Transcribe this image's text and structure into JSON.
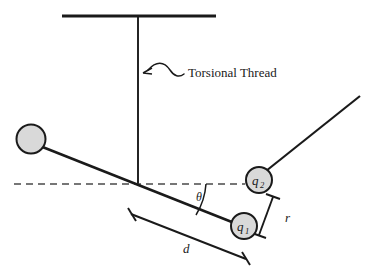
{
  "figure": {
    "background_color": "#ffffff",
    "line_color": "#1a1a1a",
    "dash_color": "#4a4a4a",
    "sphere_fill": "#d9d9d9",
    "width": 370,
    "height": 273
  },
  "labels": {
    "torsional_thread": "Torsional Thread",
    "charge_1": "q",
    "charge_1_sub": "1",
    "charge_2": "q",
    "charge_2_sub": "2",
    "angle": "θ",
    "separation": "r",
    "arm_length": "d"
  },
  "elements": {
    "ceiling_bar": "ceiling-support-bar",
    "thread": "torsional-thread-line",
    "pivot": "pivot-point",
    "rod": "balance-rod",
    "counterweight": "counterweight-sphere",
    "charge_sphere_1": "charge-sphere-q1",
    "charge_sphere_2": "charge-sphere-q2",
    "fixed_rod": "fixed-charge-rod",
    "reference_line": "horizontal-reference-dashed-line",
    "angle_arc": "angle-arc-theta",
    "dimension_r": "dimension-bracket-r",
    "dimension_d": "dimension-bracket-d",
    "pointer": "squiggle-pointer-arrow"
  },
  "geometry": {
    "ceiling_bar": {
      "x1": 62,
      "y1": 16,
      "x2": 216,
      "y2": 16
    },
    "thread": {
      "x1": 138,
      "y1": 16,
      "x2": 138,
      "y2": 185
    },
    "pivot": {
      "x": 138,
      "y": 185
    },
    "rod": {
      "x1": 40,
      "y1": 146,
      "x2": 252,
      "y2": 230
    },
    "counterweight": {
      "cx": 31,
      "cy": 139,
      "r": 14.5
    },
    "charge_1": {
      "cx": 244,
      "cy": 226,
      "r": 13
    },
    "charge_2": {
      "cx": 259,
      "cy": 180,
      "r": 13
    },
    "fixed_rod": {
      "x1": 268,
      "y1": 170,
      "x2": 360,
      "y2": 96
    },
    "reference_line": {
      "x1": 14,
      "y1": 184,
      "x2": 245,
      "y2": 184
    },
    "dimension_r": {
      "x1": 272,
      "y1": 196,
      "x2": 257,
      "y2": 236
    },
    "dimension_d": {
      "x1": 131,
      "y1": 213,
      "x2": 246,
      "y2": 259
    },
    "theta_label": {
      "x": 196,
      "y": 200
    },
    "r_label": {
      "x": 285,
      "y": 221
    },
    "d_label": {
      "x": 183,
      "y": 252
    },
    "thread_label": {
      "x": 188,
      "y": 77
    }
  }
}
